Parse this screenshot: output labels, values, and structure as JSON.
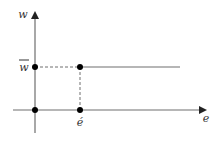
{
  "diagram": {
    "type": "step-function-graph",
    "y_axis": {
      "label": "w"
    },
    "x_axis": {
      "label": "e"
    },
    "level_label": "w",
    "level_label_bar": true,
    "threshold_label": "é",
    "colors": {
      "line": "#6e6e6e",
      "dot": "#000000",
      "text": "#333333"
    },
    "points": [
      {
        "name": "origin"
      },
      {
        "name": "w-bar-on-axis"
      },
      {
        "name": "threshold-on-axis"
      },
      {
        "name": "kink-point"
      }
    ]
  }
}
